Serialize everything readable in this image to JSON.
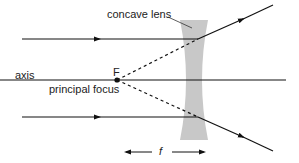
{
  "diagram": {
    "labels": {
      "lens": "concave lens",
      "axis": "axis",
      "focus_point": "F",
      "focus_name": "principal focus",
      "focal_length": "f"
    },
    "colors": {
      "ray": "#111111",
      "lens_fill": "#c8c8c8",
      "background": "#ffffff"
    }
  }
}
